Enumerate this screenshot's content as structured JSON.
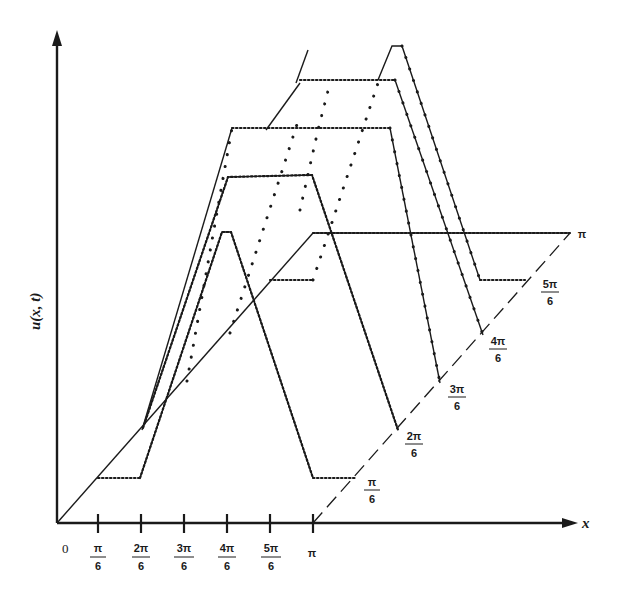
{
  "figure": {
    "y_axis_label": "u(x, t)",
    "x_axis_label": "x",
    "origin_label": "0",
    "x_ticks": [
      {
        "num": "π",
        "den": "6"
      },
      {
        "num": "2π",
        "den": "6"
      },
      {
        "num": "3π",
        "den": "6"
      },
      {
        "num": "4π",
        "den": "6"
      },
      {
        "num": "5π",
        "den": "6"
      },
      {
        "num": "π",
        "den": ""
      }
    ],
    "t_labels": [
      {
        "num": "π",
        "den": "6"
      },
      {
        "num": "2π",
        "den": "6"
      },
      {
        "num": "3π",
        "den": "6"
      },
      {
        "num": "4π",
        "den": "6"
      },
      {
        "num": "5π",
        "den": "6"
      },
      {
        "num": "π",
        "den": ""
      }
    ],
    "curves": [
      {
        "t": "π/6"
      },
      {
        "t": "2π/6"
      },
      {
        "t": "3π/6"
      },
      {
        "t": "4π/6"
      },
      {
        "t": "5π/6"
      },
      {
        "t": "π"
      }
    ]
  }
}
